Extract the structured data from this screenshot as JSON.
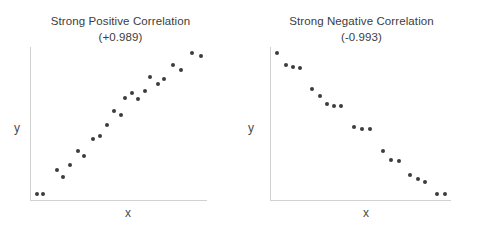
{
  "figure": {
    "background_color": "#ffffff",
    "dot_color": "#3b3b42",
    "axis_color": "#d2d2d2",
    "text_color": "#3c3c3c"
  },
  "chart_data": [
    {
      "type": "scatter",
      "title": "Strong Positive Correlation",
      "subtitle": "(+0.989)",
      "correlation": "+0.989",
      "xlabel": "x",
      "ylabel": "y",
      "grid": false,
      "legend": "none",
      "xlim": [
        0,
        100
      ],
      "ylim": [
        0,
        100
      ],
      "points": [
        {
          "x": 3,
          "y": 4
        },
        {
          "x": 8,
          "y": 4
        },
        {
          "x": 20,
          "y": 18
        },
        {
          "x": 25,
          "y": 14
        },
        {
          "x": 31,
          "y": 21
        },
        {
          "x": 38,
          "y": 29
        },
        {
          "x": 43,
          "y": 26
        },
        {
          "x": 51,
          "y": 36
        },
        {
          "x": 57,
          "y": 38
        },
        {
          "x": 63,
          "y": 44
        },
        {
          "x": 69,
          "y": 52
        },
        {
          "x": 75,
          "y": 50
        },
        {
          "x": 79,
          "y": 60
        },
        {
          "x": 85,
          "y": 63
        },
        {
          "x": 90,
          "y": 59
        },
        {
          "x": 96,
          "y": 64
        },
        {
          "x": 100,
          "y": 72
        },
        {
          "x": 107,
          "y": 68
        },
        {
          "x": 112,
          "y": 71
        },
        {
          "x": 120,
          "y": 79
        },
        {
          "x": 127,
          "y": 76
        },
        {
          "x": 136,
          "y": 86
        },
        {
          "x": 144,
          "y": 84
        }
      ]
    },
    {
      "type": "scatter",
      "title": "Strong Negative Correlation",
      "subtitle": "(-0.993)",
      "correlation": "-0.993",
      "xlabel": "x",
      "ylabel": "y",
      "grid": false,
      "legend": "none",
      "xlim": [
        0,
        100
      ],
      "ylim": [
        0,
        100
      ],
      "points": [
        {
          "x": 3,
          "y": 96
        },
        {
          "x": 12,
          "y": 88
        },
        {
          "x": 19,
          "y": 87
        },
        {
          "x": 26,
          "y": 86
        },
        {
          "x": 38,
          "y": 73
        },
        {
          "x": 45,
          "y": 68
        },
        {
          "x": 52,
          "y": 63
        },
        {
          "x": 59,
          "y": 62
        },
        {
          "x": 66,
          "y": 62
        },
        {
          "x": 79,
          "y": 48
        },
        {
          "x": 87,
          "y": 47
        },
        {
          "x": 95,
          "y": 47
        },
        {
          "x": 108,
          "y": 33
        },
        {
          "x": 116,
          "y": 27
        },
        {
          "x": 124,
          "y": 26
        },
        {
          "x": 134,
          "y": 17
        },
        {
          "x": 142,
          "y": 15
        },
        {
          "x": 149,
          "y": 13
        },
        {
          "x": 161,
          "y": 5
        },
        {
          "x": 169,
          "y": 5
        }
      ]
    }
  ],
  "panels": {
    "left": {
      "title": "Strong Positive Correlation",
      "subtitle": "(+0.989)",
      "xlabel": "x",
      "ylabel": "y"
    },
    "right": {
      "title": "Strong Negative Correlation",
      "subtitle": "(-0.993)",
      "xlabel": "x",
      "ylabel": "y"
    }
  }
}
